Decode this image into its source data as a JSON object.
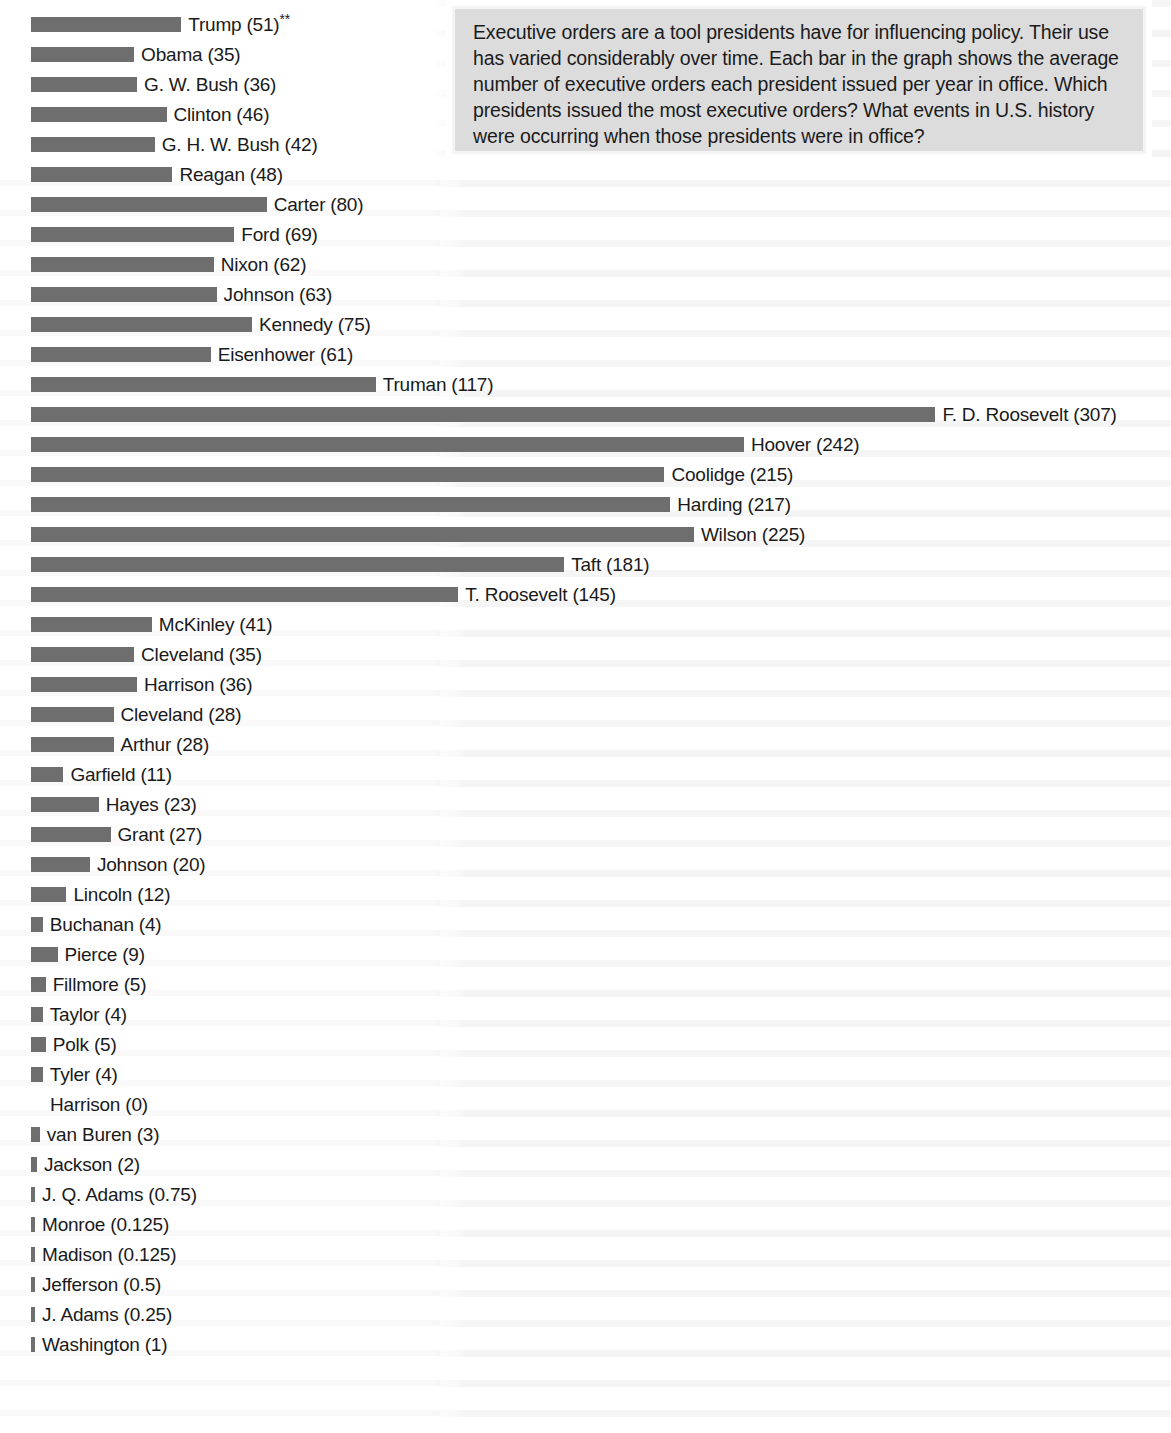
{
  "prompt": {
    "text": "Executive orders are a tool presidents have for influencing policy. Their use has varied considerably over time. Each bar in the graph shows the average number of executive orders each president issued per year in office. Which presidents issued the most executive orders? What events in U.S. history were occurring when those presidents were in office?"
  },
  "colors": {
    "bar": "#6e6e6e",
    "prompt_background": "#dcdcdc",
    "prompt_border": "#f4f4f4",
    "page_background": "#ffffff",
    "text": "#1a1a1a"
  },
  "chart_data": {
    "type": "bar",
    "orientation": "horizontal",
    "title": "",
    "subtitle": "",
    "xlabel": "",
    "ylabel": "",
    "grid": false,
    "legend": null,
    "axis_visible": false,
    "value_unit": "average executive orders per year in office",
    "xlim": [
      0,
      307
    ],
    "note_marker": "**",
    "categories": [
      "Trump",
      "Obama",
      "G. W. Bush",
      "Clinton",
      "G. H. W. Bush",
      "Reagan",
      "Carter",
      "Ford",
      "Nixon",
      "Johnson",
      "Kennedy",
      "Eisenhower",
      "Truman",
      "F. D. Roosevelt",
      "Hoover",
      "Coolidge",
      "Harding",
      "Wilson",
      "Taft",
      "T. Roosevelt",
      "McKinley",
      "Cleveland",
      "Harrison",
      "Cleveland",
      "Arthur",
      "Garfield",
      "Hayes",
      "Grant",
      "Johnson",
      "Lincoln",
      "Buchanan",
      "Pierce",
      "Fillmore",
      "Taylor",
      "Polk",
      "Tyler",
      "Harrison",
      "van Buren",
      "Jackson",
      "J. Q. Adams",
      "Monroe",
      "Madison",
      "Jefferson",
      "J. Adams",
      "Washington"
    ],
    "values": [
      51,
      35,
      36,
      46,
      42,
      48,
      80,
      69,
      62,
      63,
      75,
      61,
      117,
      307,
      242,
      215,
      217,
      225,
      181,
      145,
      41,
      35,
      36,
      28,
      28,
      11,
      23,
      27,
      20,
      12,
      4,
      9,
      5,
      4,
      5,
      4,
      0,
      3,
      2,
      0.75,
      0.125,
      0.125,
      0.5,
      0.25,
      1
    ],
    "bars": [
      {
        "label": "Trump (51)**",
        "name": "Trump",
        "value": 51,
        "footnote": "**"
      },
      {
        "label": "Obama (35)",
        "name": "Obama",
        "value": 35,
        "footnote": ""
      },
      {
        "label": "G. W. Bush (36)",
        "name": "G. W. Bush",
        "value": 36,
        "footnote": ""
      },
      {
        "label": "Clinton (46)",
        "name": "Clinton",
        "value": 46,
        "footnote": ""
      },
      {
        "label": "G. H. W. Bush (42)",
        "name": "G. H. W. Bush",
        "value": 42,
        "footnote": ""
      },
      {
        "label": "Reagan (48)",
        "name": "Reagan",
        "value": 48,
        "footnote": ""
      },
      {
        "label": "Carter (80)",
        "name": "Carter",
        "value": 80,
        "footnote": ""
      },
      {
        "label": "Ford (69)",
        "name": "Ford",
        "value": 69,
        "footnote": ""
      },
      {
        "label": "Nixon (62)",
        "name": "Nixon",
        "value": 62,
        "footnote": ""
      },
      {
        "label": "Johnson (63)",
        "name": "Johnson",
        "value": 63,
        "footnote": ""
      },
      {
        "label": "Kennedy (75)",
        "name": "Kennedy",
        "value": 75,
        "footnote": ""
      },
      {
        "label": "Eisenhower (61)",
        "name": "Eisenhower",
        "value": 61,
        "footnote": ""
      },
      {
        "label": "Truman (117)",
        "name": "Truman",
        "value": 117,
        "footnote": ""
      },
      {
        "label": "F. D. Roosevelt (307)",
        "name": "F. D. Roosevelt",
        "value": 307,
        "footnote": ""
      },
      {
        "label": "Hoover (242)",
        "name": "Hoover",
        "value": 242,
        "footnote": ""
      },
      {
        "label": "Coolidge (215)",
        "name": "Coolidge",
        "value": 215,
        "footnote": ""
      },
      {
        "label": "Harding (217)",
        "name": "Harding",
        "value": 217,
        "footnote": ""
      },
      {
        "label": "Wilson (225)",
        "name": "Wilson",
        "value": 225,
        "footnote": ""
      },
      {
        "label": "Taft (181)",
        "name": "Taft",
        "value": 181,
        "footnote": ""
      },
      {
        "label": "T. Roosevelt (145)",
        "name": "T. Roosevelt",
        "value": 145,
        "footnote": ""
      },
      {
        "label": "McKinley (41)",
        "name": "McKinley",
        "value": 41,
        "footnote": ""
      },
      {
        "label": "Cleveland (35)",
        "name": "Cleveland",
        "value": 35,
        "footnote": ""
      },
      {
        "label": "Harrison (36)",
        "name": "Harrison",
        "value": 36,
        "footnote": ""
      },
      {
        "label": "Cleveland (28)",
        "name": "Cleveland",
        "value": 28,
        "footnote": ""
      },
      {
        "label": "Arthur (28)",
        "name": "Arthur",
        "value": 28,
        "footnote": ""
      },
      {
        "label": "Garfield (11)",
        "name": "Garfield",
        "value": 11,
        "footnote": ""
      },
      {
        "label": "Hayes (23)",
        "name": "Hayes",
        "value": 23,
        "footnote": ""
      },
      {
        "label": "Grant (27)",
        "name": "Grant",
        "value": 27,
        "footnote": ""
      },
      {
        "label": "Johnson (20)",
        "name": "Johnson",
        "value": 20,
        "footnote": ""
      },
      {
        "label": "Lincoln (12)",
        "name": "Lincoln",
        "value": 12,
        "footnote": ""
      },
      {
        "label": "Buchanan (4)",
        "name": "Buchanan",
        "value": 4,
        "footnote": ""
      },
      {
        "label": "Pierce (9)",
        "name": "Pierce",
        "value": 9,
        "footnote": ""
      },
      {
        "label": "Fillmore (5)",
        "name": "Fillmore",
        "value": 5,
        "footnote": ""
      },
      {
        "label": "Taylor (4)",
        "name": "Taylor",
        "value": 4,
        "footnote": ""
      },
      {
        "label": "Polk (5)",
        "name": "Polk",
        "value": 5,
        "footnote": ""
      },
      {
        "label": "Tyler (4)",
        "name": "Tyler",
        "value": 4,
        "footnote": ""
      },
      {
        "label": "Harrison (0)",
        "name": "Harrison",
        "value": 0,
        "footnote": ""
      },
      {
        "label": "van Buren (3)",
        "name": "van Buren",
        "value": 3,
        "footnote": ""
      },
      {
        "label": "Jackson (2)",
        "name": "Jackson",
        "value": 2,
        "footnote": ""
      },
      {
        "label": "J. Q. Adams (0.75)",
        "name": "J. Q. Adams",
        "value": 0.75,
        "footnote": ""
      },
      {
        "label": "Monroe (0.125)",
        "name": "Monroe",
        "value": 0.125,
        "footnote": ""
      },
      {
        "label": "Madison (0.125)",
        "name": "Madison",
        "value": 0.125,
        "footnote": ""
      },
      {
        "label": "Jefferson (0.5)",
        "name": "Jefferson",
        "value": 0.5,
        "footnote": ""
      },
      {
        "label": "J. Adams (0.25)",
        "name": "J. Adams",
        "value": 0.25,
        "footnote": ""
      },
      {
        "label": "Washington (1)",
        "name": "Washington",
        "value": 1,
        "footnote": ""
      }
    ]
  },
  "layout": {
    "bar_origin_x": 31,
    "row_height": 30,
    "first_row_y": 9,
    "px_per_unit": 2.946,
    "bar_thickness": 15,
    "min_bar_px": 4
  }
}
